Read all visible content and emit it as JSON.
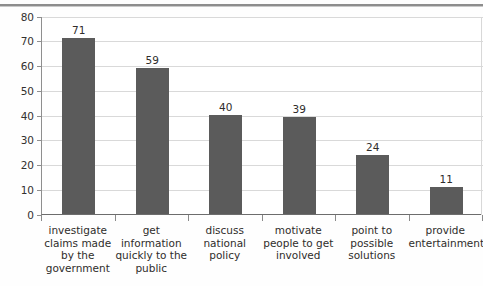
{
  "chart_data": {
    "type": "bar",
    "title": "",
    "subtitle": "",
    "xlabel": "",
    "ylabel": "",
    "ylim": [
      0,
      80
    ],
    "grid": true,
    "legend": "none",
    "orientation": "vertical",
    "bar_color": "#5b5b5b",
    "categories": [
      "investigate claims made by the government",
      "get information quickly to the public",
      "discuss national policy",
      "motivate people to get involved",
      "point to possible solutions",
      "provide entertainment"
    ],
    "category_lines": [
      [
        "investigate",
        "claims made",
        "by the",
        "government"
      ],
      [
        "get",
        "information",
        "quickly to the",
        "public"
      ],
      [
        "discuss",
        "national",
        "policy"
      ],
      [
        "motivate",
        "people to get",
        "involved"
      ],
      [
        "point to",
        "possible",
        "solutions"
      ],
      [
        "provide",
        "entertainment"
      ]
    ],
    "values": [
      71,
      59,
      40,
      39,
      24,
      11
    ],
    "value_labels": [
      "71",
      "59",
      "40",
      "39",
      "24",
      "11"
    ],
    "yticks": [
      0,
      10,
      20,
      30,
      40,
      50,
      60,
      70,
      80
    ],
    "ytick_labels": [
      "0",
      "10",
      "20",
      "30",
      "40",
      "50",
      "60",
      "70",
      "80"
    ]
  }
}
